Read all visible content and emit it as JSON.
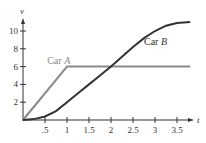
{
  "chart_data": {
    "type": "line",
    "title": "",
    "xlabel": "t",
    "ylabel": "v",
    "xlim": [
      0,
      3.9
    ],
    "ylim": [
      0,
      11.5
    ],
    "x_ticks": [
      0.5,
      1,
      1.5,
      2,
      2.5,
      3,
      3.5
    ],
    "x_tick_labels": [
      ".5",
      "1",
      "1.5",
      "2",
      "2.5",
      "3",
      "3.5"
    ],
    "y_ticks": [
      2,
      4,
      6,
      8,
      10
    ],
    "y_tick_labels": [
      "2",
      "4",
      "6",
      "8",
      "10"
    ],
    "grid": false,
    "legend": "inline labels",
    "series": [
      {
        "name": "Car A",
        "color": "#8a8a8a",
        "x": [
          0,
          1,
          3.8
        ],
        "y": [
          0,
          6,
          6
        ]
      },
      {
        "name": "Car B",
        "color": "#333333",
        "x": [
          0,
          0.25,
          0.5,
          0.75,
          1,
          1.25,
          1.5,
          1.75,
          2,
          2.25,
          2.5,
          2.75,
          3,
          3.25,
          3.5,
          3.8
        ],
        "y": [
          0,
          0.1,
          0.4,
          1.0,
          2.0,
          3.0,
          4.0,
          5.0,
          6.0,
          7.1,
          8.2,
          9.2,
          10.0,
          10.6,
          10.9,
          11.0
        ]
      }
    ],
    "annotations": [
      {
        "text": "Car A",
        "x": 0.55,
        "y": 6.3
      },
      {
        "text": "Car B",
        "x": 2.75,
        "y": 8.4
      }
    ]
  }
}
